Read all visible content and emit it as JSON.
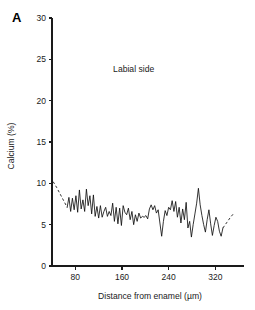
{
  "figure": {
    "panel_label": "A",
    "background_color": "#ffffff",
    "line_color": "#111111",
    "axis_color": "#1a1a1a"
  },
  "chart_data": {
    "type": "line",
    "title": "",
    "subtitle": "",
    "annotations": [
      {
        "text": "Labial side",
        "x": 180,
        "y": 23.5
      }
    ],
    "xlabel": "Distance from enamel (µm)",
    "ylabel": "Calcium (%)",
    "xlim": [
      40,
      352
    ],
    "ylim": [
      0,
      30
    ],
    "xticks": [
      80,
      160,
      240,
      320
    ],
    "xtick_labels": [
      "80",
      "160",
      "240",
      "320"
    ],
    "yticks": [
      0,
      5,
      10,
      15,
      20,
      25,
      30
    ],
    "ytick_labels": [
      "0",
      "5",
      "10",
      "15",
      "20",
      "25",
      "30"
    ],
    "grid": false,
    "legend": "none",
    "series": [
      {
        "name": "Calcium profile (extrapolated start)",
        "style": "dashed",
        "x": [
          42,
          48,
          54,
          60,
          66
        ],
        "values": [
          10.2,
          9.5,
          8.7,
          7.9,
          7.1
        ]
      },
      {
        "name": "Calcium profile (measured)",
        "style": "solid",
        "x": [
          66,
          69,
          72,
          75,
          78,
          81,
          84,
          87,
          90,
          93,
          96,
          99,
          102,
          105,
          108,
          111,
          114,
          117,
          120,
          123,
          126,
          129,
          132,
          135,
          138,
          141,
          144,
          147,
          150,
          153,
          156,
          159,
          162,
          165,
          168,
          171,
          174,
          177,
          180,
          183,
          186,
          189,
          192,
          195,
          198,
          201,
          204,
          207,
          210,
          213,
          216,
          219,
          222,
          225,
          228,
          231,
          234,
          237,
          240,
          243,
          246,
          249,
          252,
          255,
          258,
          261,
          264,
          267,
          270,
          273,
          276,
          279,
          282,
          285,
          288,
          291,
          294,
          297,
          300,
          303,
          306,
          309,
          312,
          315,
          318,
          321,
          324,
          327,
          330,
          333
        ],
        "values": [
          7.1,
          8.3,
          6.6,
          8.2,
          6.8,
          8.5,
          6.5,
          9.2,
          6.9,
          8.0,
          6.6,
          9.3,
          7.3,
          8.5,
          6.3,
          8.6,
          6.0,
          7.2,
          5.8,
          7.3,
          5.9,
          6.6,
          7.1,
          6.0,
          6.6,
          6.1,
          7.6,
          5.4,
          7.1,
          5.1,
          7.0,
          4.9,
          7.3,
          6.5,
          6.2,
          7.0,
          5.6,
          6.6,
          5.0,
          6.2,
          5.4,
          6.4,
          5.8,
          6.0,
          5.9,
          6.1,
          5.7,
          6.9,
          7.4,
          6.8,
          7.3,
          6.4,
          6.8,
          5.2,
          3.6,
          5.4,
          6.7,
          6.1,
          7.1,
          6.8,
          7.9,
          6.6,
          7.8,
          5.9,
          7.1,
          5.2,
          6.9,
          5.6,
          7.7,
          4.6,
          5.4,
          3.5,
          5.0,
          6.3,
          7.6,
          9.4,
          7.4,
          6.1,
          5.0,
          4.1,
          5.6,
          6.8,
          5.1,
          3.7,
          4.9,
          5.9,
          5.4,
          4.2,
          3.6,
          4.6
        ]
      },
      {
        "name": "Calcium profile (extrapolated end)",
        "style": "dashed",
        "x": [
          333,
          340,
          346,
          352
        ],
        "values": [
          4.6,
          5.3,
          5.9,
          6.4
        ]
      }
    ]
  }
}
